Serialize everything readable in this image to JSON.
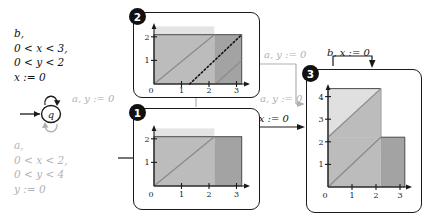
{
  "figure": {
    "colors": {
      "ink": "#1a1a1a",
      "dim": "#b0b0b0",
      "zone_light": "#e2e2e2",
      "zone_mid": "#b9b9b9",
      "zone_dark": "#a0a0a0"
    }
  },
  "automaton": {
    "state_label": "q",
    "initial_arrow": true,
    "self_loop_top": {
      "style": "solid",
      "color": "#1a1a1a"
    },
    "self_loop_bottom": {
      "style": "solid",
      "color": "#b0b0b0"
    },
    "guard_top": [
      "b,",
      "0 < x < 3,",
      "0 < y < 2",
      "x := 0"
    ],
    "guard_bottom": [
      "a,",
      "0 < x < 2,",
      "0 < y < 4",
      "y := 0"
    ]
  },
  "edges": {
    "a_left": "a, y := 0",
    "a_mid": "a, y := 0",
    "a_low": "a, y := 0",
    "b_mid": "b, x := 0",
    "b_top": "b, x := 0"
  },
  "panels": [
    {
      "badge": "1",
      "xlabel": "",
      "ylabel": "",
      "xticks": [
        "0",
        "1",
        "2",
        "3"
      ],
      "yticks": [
        "1",
        "2"
      ],
      "xlim": [
        0,
        3.5
      ],
      "ylim": [
        0,
        2.6
      ],
      "zones": [
        {
          "name": "light-overhang",
          "shade": "light",
          "x0": 0,
          "x1": 2.2,
          "y0": 2.2,
          "y1": 2.55
        },
        {
          "name": "mid-square",
          "shade": "mid",
          "x0": 0,
          "x1": 2.2,
          "y0": 0,
          "y1": 2.2
        },
        {
          "name": "dark-strip",
          "shade": "dark",
          "x0": 2.2,
          "x1": 3.2,
          "y0": 0,
          "y1": 2.2
        }
      ],
      "diagonals": [
        {
          "style": "solid",
          "x0": 0,
          "y0": 0,
          "x1": 2.2,
          "y1": 2.2
        }
      ]
    },
    {
      "badge": "2",
      "xticks": [
        "0",
        "1",
        "2",
        "3"
      ],
      "yticks": [
        "1",
        "2"
      ],
      "xlim": [
        0,
        3.5
      ],
      "ylim": [
        0,
        2.6
      ],
      "zones": [
        {
          "name": "light-overhang",
          "shade": "light",
          "x0": 0,
          "x1": 2.2,
          "y0": 2.2,
          "y1": 2.55
        },
        {
          "name": "mid-square",
          "shade": "mid",
          "x0": 0,
          "x1": 2.2,
          "y0": 0,
          "y1": 2.2
        },
        {
          "name": "dark-strip",
          "shade": "dark",
          "x0": 2.2,
          "x1": 3.2,
          "y0": 0,
          "y1": 2.2
        }
      ],
      "diagonals": [
        {
          "style": "solid",
          "x0": 0,
          "y0": 0,
          "x1": 2.2,
          "y1": 2.2
        },
        {
          "style": "solid",
          "x0": 2.25,
          "y0": 0,
          "x1": 3.2,
          "y1": 0.95
        },
        {
          "style": "dotted",
          "x0": 1.3,
          "y0": 0,
          "x1": 3.2,
          "y1": 2.1
        }
      ]
    },
    {
      "badge": "3",
      "xticks": [
        "0",
        "1",
        "2",
        "3"
      ],
      "yticks": [
        "1",
        "2",
        "3",
        "4"
      ],
      "xlim": [
        0,
        3.5
      ],
      "ylim": [
        0,
        4.6
      ],
      "zones": [
        {
          "name": "upper-light-square",
          "shade": "light",
          "x0": 0,
          "x1": 2.2,
          "y0": 2.2,
          "y1": 4.35
        },
        {
          "name": "lower-mid-square",
          "shade": "mid",
          "x0": 0,
          "x1": 2.2,
          "y0": 0,
          "y1": 2.2
        },
        {
          "name": "lower-dark-strip",
          "shade": "dark",
          "x0": 2.2,
          "x1": 3.2,
          "y0": 0,
          "y1": 2.2
        }
      ],
      "diagonals": [
        {
          "style": "solid",
          "x0": 0,
          "y0": 2.2,
          "x1": 2.2,
          "y1": 4.35
        },
        {
          "style": "solid",
          "x0": 0,
          "y0": 0,
          "x1": 2.2,
          "y1": 2.2
        }
      ]
    }
  ]
}
